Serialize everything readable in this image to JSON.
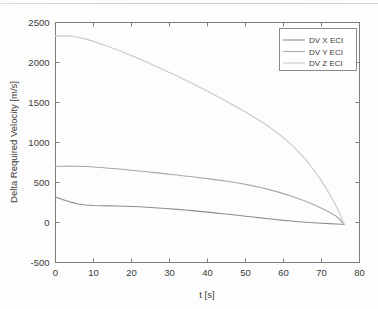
{
  "chart_data": {
    "type": "line",
    "title": "",
    "xlabel": "t [s]",
    "ylabel": "Delta Required Velocity [m/s]",
    "xlim": [
      0,
      80
    ],
    "ylim": [
      -500,
      2500
    ],
    "xticks": [
      0,
      10,
      20,
      30,
      40,
      50,
      60,
      70,
      80
    ],
    "xtick_labels": [
      "0",
      "10",
      "20",
      "30",
      "40",
      "50",
      "60",
      "70",
      "80"
    ],
    "yticks": [
      -500,
      0,
      500,
      1000,
      1500,
      2000,
      2500
    ],
    "ytick_labels": [
      "-500",
      "0",
      "500",
      "1000",
      "1500",
      "2000",
      "2500"
    ],
    "grid": false,
    "legend_position": "upper right",
    "legend_entries": [
      "DV X ECI",
      "DV Y ECI",
      "DV Z ECI"
    ],
    "x": [
      0,
      2,
      4,
      6,
      8,
      10,
      12,
      14,
      16,
      18,
      20,
      22,
      24,
      26,
      28,
      30,
      32,
      34,
      36,
      38,
      40,
      42,
      44,
      46,
      48,
      50,
      52,
      54,
      56,
      58,
      60,
      62,
      64,
      66,
      68,
      70,
      72,
      74,
      76
    ],
    "series": [
      {
        "name": "DV X ECI",
        "color": "#8d8d8d",
        "values": [
          320,
          285,
          255,
          232,
          218,
          212,
          210,
          208,
          206,
          203,
          200,
          196,
          191,
          185,
          179,
          172,
          164,
          156,
          148,
          139,
          130,
          120,
          110,
          100,
          90,
          79,
          68,
          58,
          47,
          37,
          27,
          18,
          10,
          3,
          -4,
          -10,
          -14,
          -18,
          -25
        ]
      },
      {
        "name": "DV Y ECI",
        "color": "#a8a8a8",
        "values": [
          700,
          703,
          705,
          704,
          700,
          694,
          687,
          679,
          671,
          662,
          653,
          644,
          634,
          624,
          614,
          604,
          593,
          582,
          571,
          560,
          548,
          536,
          523,
          509,
          494,
          477,
          458,
          437,
          414,
          389,
          361,
          331,
          298,
          262,
          222,
          178,
          130,
          75,
          -25
        ]
      },
      {
        "name": "DV Z ECI",
        "color": "#c9c9c9",
        "values": [
          2330,
          2335,
          2330,
          2315,
          2292,
          2264,
          2232,
          2198,
          2162,
          2125,
          2086,
          2046,
          2005,
          1963,
          1920,
          1876,
          1831,
          1785,
          1738,
          1690,
          1641,
          1591,
          1540,
          1488,
          1435,
          1381,
          1325,
          1266,
          1203,
          1135,
          1060,
          976,
          882,
          776,
          656,
          520,
          366,
          192,
          -25
        ]
      }
    ]
  },
  "axes": {
    "ylabel": "Delta Required Velocity [m/s]",
    "xlabel": "t [s]"
  }
}
